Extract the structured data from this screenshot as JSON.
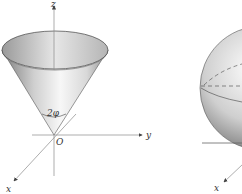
{
  "figure": {
    "cone": {
      "axis_labels": {
        "z": "z",
        "y": "y",
        "x": "x"
      },
      "origin_label": "O",
      "angle_label": "2φ"
    },
    "sphere": {
      "axis_labels": {
        "x": "x"
      }
    }
  },
  "colors": {
    "axis": "#7a7a7a",
    "surface_light": "#f4f4f4",
    "surface_dark": "#8a8a8a",
    "outline": "#444444"
  }
}
